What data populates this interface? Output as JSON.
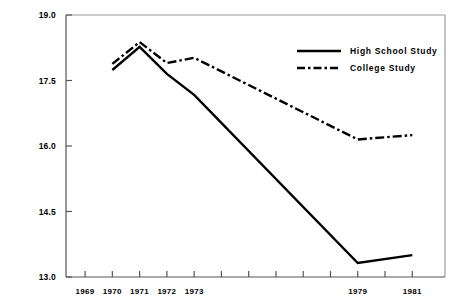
{
  "chart_data": {
    "type": "line",
    "title": "",
    "xlabel": "",
    "ylabel": "Mean  Social  Criticism",
    "ylim": [
      13.0,
      19.0
    ],
    "yticks": [
      "13.0",
      "14.5",
      "16.0",
      "17.5",
      "19.0"
    ],
    "ytick_values": [
      13.0,
      14.5,
      16.0,
      17.5,
      19.0
    ],
    "x": [
      1970,
      1971,
      1972,
      1973,
      1979,
      1981
    ],
    "xtick_labels": [
      "1969",
      "1970",
      "1971",
      "1972",
      "1973",
      "",
      "",
      "",
      "",
      "",
      "1979",
      "",
      "1981"
    ],
    "xtick_values": [
      1969,
      1970,
      1971,
      1972,
      1973,
      1974,
      1975,
      1976,
      1977,
      1978,
      1979,
      1980,
      1981
    ],
    "xlim": [
      1968.3,
      1982.2
    ],
    "grid": false,
    "legend_position": "top-right",
    "series": [
      {
        "name": "High School Study",
        "style": "solid",
        "color": "#000000",
        "values": [
          17.74,
          18.27,
          17.65,
          17.17,
          13.32,
          13.5
        ]
      },
      {
        "name": "College Study",
        "style": "dash-dot",
        "color": "#000000",
        "values": [
          17.88,
          18.38,
          17.9,
          18.02,
          16.15,
          16.25
        ]
      }
    ]
  },
  "legend": {
    "items": [
      {
        "label": "High School Study",
        "style": "solid"
      },
      {
        "label": "College Study",
        "style": "dash-dot"
      }
    ]
  }
}
